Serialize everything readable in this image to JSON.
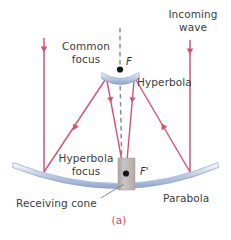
{
  "figure": {
    "caption": "(a)",
    "labels": {
      "incoming_wave": "Incoming\nwave",
      "common_focus": "Common\nfocus",
      "hyperbola": "Hyperbola",
      "hyperbola_focus": "Hyperbola\nfocus",
      "receiving_cone": "Receiving cone",
      "parabola": "Parabola",
      "focus_point_F": "F",
      "focus_point_F_prime": "F'"
    },
    "colors": {
      "ray": "#d94f72",
      "mirror_blue": "#a8b8dc",
      "mirror_blue_dark": "#7f93c4",
      "cone_gray": "#b9b3b0",
      "axis_dash": "#8c8c93",
      "text": "#3b3b42",
      "caption": "#cf4a6e",
      "background": "#ffffff"
    },
    "elements": {
      "parabola_name": "parabolic-reflector-dish",
      "hyperbola_name": "hyperbolic-subreflector",
      "cone_name": "receiving-cone",
      "axis_name": "optical-axis-dashed-line",
      "focus_F_name": "common-focus-point",
      "focus_Fprime_name": "hyperbola-focus-point",
      "incoming_rays_count": 2,
      "reflected_rays_count": 2
    },
    "geometry": {
      "parabola_vertex": [
        120,
        188
      ],
      "parabola_left_end": [
        13,
        163
      ],
      "parabola_right_end": [
        218,
        163
      ],
      "hyperbola_center": [
        120,
        79
      ],
      "hyperbola_half_width": 17,
      "focus_F": [
        120,
        70
      ],
      "focus_F_prime": [
        126,
        174
      ],
      "incoming_ray_left_x": 44,
      "incoming_ray_right_x": 190,
      "incoming_ray_top_y": 38,
      "cone_rect": [
        118,
        158,
        17,
        32
      ]
    }
  }
}
